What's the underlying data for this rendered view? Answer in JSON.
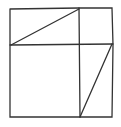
{
  "diagram": {
    "stroke_color": "#333333",
    "background": "#ffffff",
    "outer": {
      "x1": 10,
      "y1": 8,
      "x2": 113,
      "y2": 117
    },
    "vertical_divider_x": 79,
    "horizontal_divider_y": 45,
    "diagonals": [
      {
        "name": "top-left-diagonal",
        "from": [
          11,
          45
        ],
        "to": [
          79,
          9
        ]
      },
      {
        "name": "bottom-right-diagonal",
        "from": [
          112,
          44
        ],
        "to": [
          80,
          117
        ]
      }
    ]
  }
}
